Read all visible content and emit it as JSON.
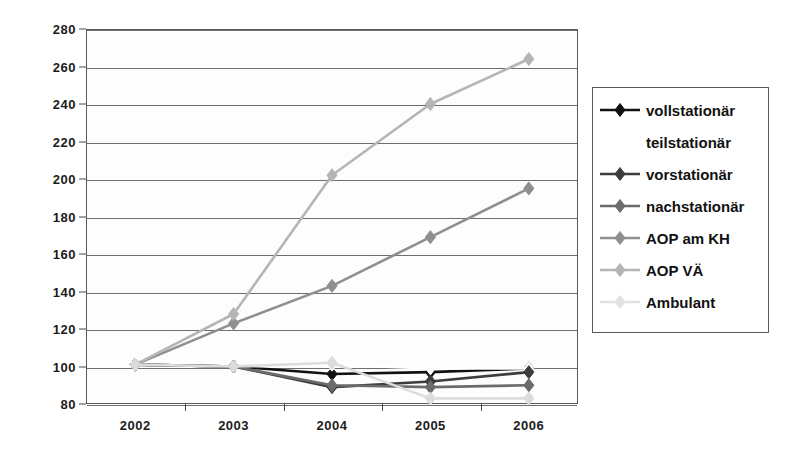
{
  "chart_data": {
    "type": "line",
    "title": "",
    "xlabel": "",
    "ylabel": "",
    "categories": [
      "2002",
      "2003",
      "2004",
      "2005",
      "2006"
    ],
    "x": [
      2002,
      2003,
      2004,
      2005,
      2006
    ],
    "ylim": [
      80,
      280
    ],
    "ytick_step": 20,
    "yticks": [
      80,
      100,
      120,
      140,
      160,
      180,
      200,
      220,
      240,
      260,
      280
    ],
    "ytick_labels": [
      "80",
      "100",
      "120",
      "140",
      "160",
      "180",
      "200",
      "220",
      "240",
      "260",
      "280"
    ],
    "grid": true,
    "legend_position": "right",
    "series": [
      {
        "name": "vollstationär",
        "color": "#111111",
        "values": [
          101,
          100,
          96,
          97,
          99
        ]
      },
      {
        "name": "teilstationär",
        "color": "#ffffff",
        "values": [
          101,
          100,
          101,
          99,
          99
        ]
      },
      {
        "name": "vorstationär",
        "color": "#3d3d3d",
        "values": [
          101,
          100,
          89,
          92,
          97
        ]
      },
      {
        "name": "nachstationär",
        "color": "#6b6b6b",
        "values": [
          101,
          100,
          90,
          89,
          90
        ]
      },
      {
        "name": "AOP am KH",
        "color": "#8f8f8f",
        "values": [
          101,
          123,
          143,
          169,
          195
        ]
      },
      {
        "name": "AOP VÄ",
        "color": "#b5b5b5",
        "values": [
          101,
          128,
          202,
          240,
          264
        ]
      },
      {
        "name": "Ambulant",
        "color": "#dcdcdc",
        "values": [
          101,
          100,
          102,
          83,
          83
        ]
      }
    ]
  },
  "legend": {
    "items": [
      {
        "label": "vollstationär",
        "color": "#111111",
        "marker": true
      },
      {
        "label": "teilstationär",
        "color": "#ffffff",
        "marker": false
      },
      {
        "label": "vorstationär",
        "color": "#3d3d3d",
        "marker": true
      },
      {
        "label": "nachstationär",
        "color": "#6b6b6b",
        "marker": true
      },
      {
        "label": "AOP am KH",
        "color": "#8f8f8f",
        "marker": true
      },
      {
        "label": "AOP VÄ",
        "color": "#b5b5b5",
        "marker": true
      },
      {
        "label": "Ambulant",
        "color": "#e2e2e2",
        "marker": true
      }
    ]
  }
}
